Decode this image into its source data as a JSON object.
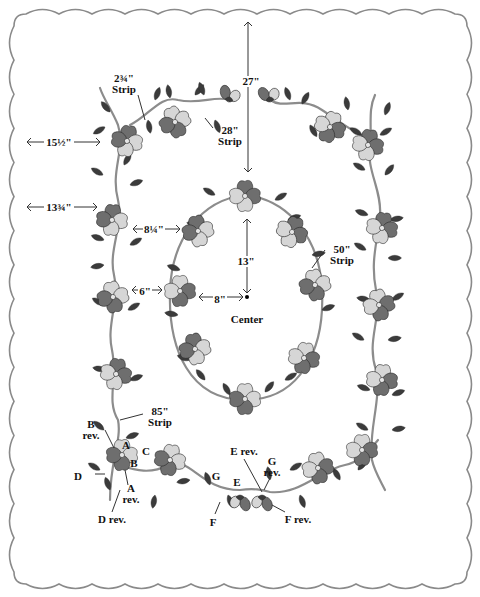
{
  "diagram": {
    "colors": {
      "background": "#ffffff",
      "scallop_border": "#8a8a8a",
      "petal_dark": "#6e6e6e",
      "petal_light": "#d6d6d6",
      "leaf": "#3b3b3b",
      "stem": "#8c8c8c",
      "outline": "#2a2a2a",
      "center": "#e6e6e6",
      "text": "#111111",
      "dimension_line": "#333333"
    },
    "measurements": {
      "top_to_oval": "27\"",
      "left_edge_to_border_top": "15½\"",
      "left_edge_to_border": "13¾\"",
      "border_to_oval_upper": "8¼\"",
      "border_to_oval_mid": "6\"",
      "oval_to_center_horizontal": "8\"",
      "oval_to_center_vertical": "13\"",
      "center_label": "Center"
    },
    "strips": {
      "corner_strip": {
        "size": "2¾\"",
        "label": "Strip"
      },
      "top_strip": {
        "size": "28\"",
        "label": "Strip"
      },
      "oval_strip": {
        "size": "50\"",
        "label": "Strip"
      },
      "side_strip": {
        "size": "85\"",
        "label": "Strip"
      }
    },
    "pattern_pieces": [
      {
        "id": "A",
        "label": "A"
      },
      {
        "id": "A-rev",
        "label": "A",
        "sub": "rev."
      },
      {
        "id": "B",
        "label": "B"
      },
      {
        "id": "B-rev",
        "label": "B",
        "sub": "rev."
      },
      {
        "id": "C",
        "label": "C"
      },
      {
        "id": "D",
        "label": "D"
      },
      {
        "id": "D-rev",
        "label": "D rev."
      },
      {
        "id": "E",
        "label": "E"
      },
      {
        "id": "E-rev",
        "label": "E rev."
      },
      {
        "id": "F",
        "label": "F"
      },
      {
        "id": "F-rev",
        "label": "F rev."
      },
      {
        "id": "G",
        "label": "G"
      },
      {
        "id": "G-rev",
        "label": "G",
        "sub": "rev."
      }
    ]
  }
}
